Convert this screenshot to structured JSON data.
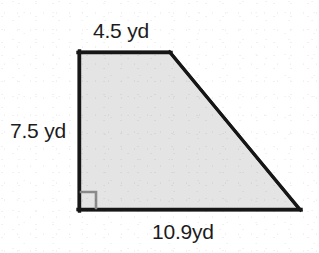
{
  "figure": {
    "kind": "geometry-diagram",
    "shape_name": "right trapezoid",
    "background_color": "#ffffff",
    "fill_color": "#e4e4e4",
    "stroke_color": "#1a1a1a",
    "stroke_width": 3,
    "vertices": [
      {
        "name": "top-left",
        "x": 79,
        "y": 52
      },
      {
        "name": "top-right",
        "x": 170,
        "y": 52
      },
      {
        "name": "bottom-right",
        "x": 300,
        "y": 210
      },
      {
        "name": "bottom-left",
        "x": 79,
        "y": 210
      }
    ],
    "right_angle_marker": {
      "corner": "bottom-left",
      "color": "#8a8a8a",
      "size": 16,
      "x": 79,
      "y": 194
    }
  },
  "labels": {
    "top": "4.5 yd",
    "left": "7.5 yd",
    "bottom": "10.9yd"
  },
  "measurements": {
    "unit": "yd",
    "top_side": 4.5,
    "left_side": 7.5,
    "bottom_side": 10.9
  }
}
